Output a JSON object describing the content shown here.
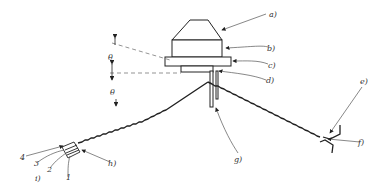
{
  "diagram": {
    "type": "technical-drawing",
    "labels": {
      "a": "a)",
      "b": "b)",
      "c": "c)",
      "d": "d)",
      "e": "e)",
      "f": "f)",
      "g": "g)",
      "h": "h)",
      "i": "i)",
      "n1": "1",
      "n2": "2",
      "n3": "3",
      "n4": "4",
      "theta_upper": "θ",
      "theta_lower": "θ"
    },
    "colors": {
      "line": "#222222",
      "leader": "#555555",
      "dashed": "#666666"
    }
  }
}
